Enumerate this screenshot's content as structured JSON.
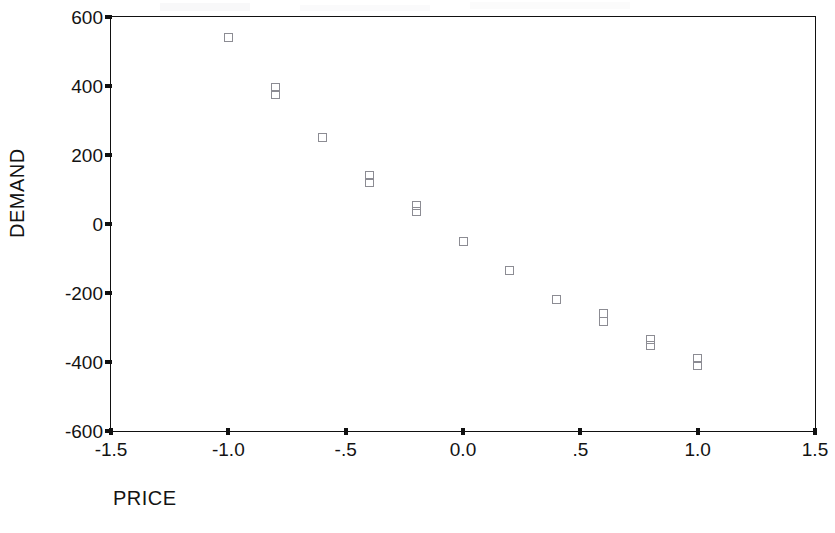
{
  "chart_data": {
    "type": "scatter",
    "title": "",
    "xlabel": "PRICE",
    "ylabel": "DEMAND",
    "xlim": [
      -1.5,
      1.5
    ],
    "ylim": [
      -600,
      600
    ],
    "xticks": [
      -1.5,
      -1.0,
      -0.5,
      0.0,
      0.5,
      1.0,
      1.5
    ],
    "xticklabels": [
      "-1.5",
      "-1.0",
      "-.5",
      "0.0",
      ".5",
      "1.0",
      "1.5"
    ],
    "yticks": [
      600,
      400,
      200,
      0,
      -200,
      -400,
      -600
    ],
    "yticklabels": [
      "600",
      "400",
      "200",
      "0",
      "-200",
      "-400",
      "-600"
    ],
    "grid": false,
    "legend": null,
    "marker": "open-square",
    "marker_color": "#8c8c93",
    "frame_color": "#111111",
    "series": [
      {
        "name": "DEMAND vs PRICE",
        "points": [
          {
            "x": -1.0,
            "y": 540
          },
          {
            "x": -0.8,
            "y": 395
          },
          {
            "x": -0.8,
            "y": 375
          },
          {
            "x": -0.6,
            "y": 250
          },
          {
            "x": -0.4,
            "y": 140
          },
          {
            "x": -0.4,
            "y": 120
          },
          {
            "x": -0.2,
            "y": 55
          },
          {
            "x": -0.2,
            "y": 35
          },
          {
            "x": 0.0,
            "y": -50
          },
          {
            "x": 0.2,
            "y": -135
          },
          {
            "x": 0.4,
            "y": -218
          },
          {
            "x": 0.6,
            "y": -258
          },
          {
            "x": 0.6,
            "y": -282
          },
          {
            "x": 0.8,
            "y": -335
          },
          {
            "x": 0.8,
            "y": -352
          },
          {
            "x": 1.0,
            "y": -390
          },
          {
            "x": 1.0,
            "y": -410
          }
        ]
      }
    ]
  }
}
